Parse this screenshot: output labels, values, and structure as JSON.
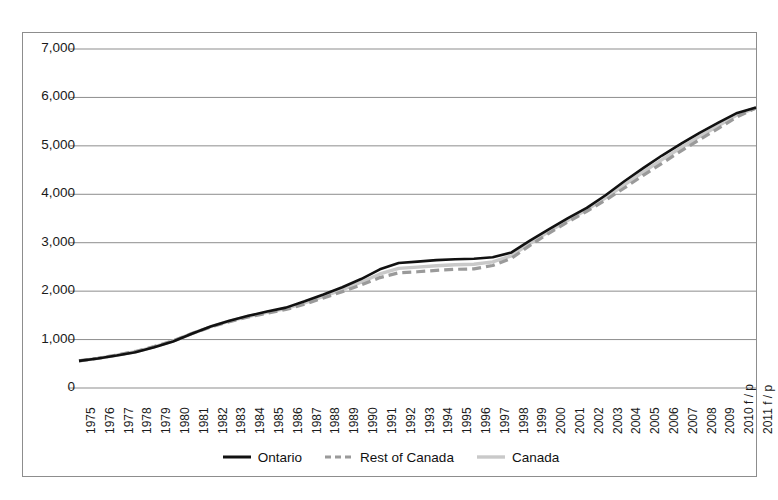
{
  "chart_data": {
    "type": "line",
    "title": "",
    "xlabel": "",
    "ylabel": "",
    "ylim": [
      0,
      7000
    ],
    "ytick_values": [
      0,
      1000,
      2000,
      3000,
      4000,
      5000,
      6000,
      7000
    ],
    "ytick_labels": [
      "0",
      "1,000",
      "2,000",
      "3,000",
      "4,000",
      "5,000",
      "6,000",
      "7,000"
    ],
    "grid": true,
    "grid_axis": "y",
    "legend_position": "bottom-center",
    "categories": [
      "1975",
      "1976",
      "1977",
      "1978",
      "1979",
      "1980",
      "1981",
      "1982",
      "1983",
      "1984",
      "1985",
      "1986",
      "1987",
      "1988",
      "1989",
      "1990",
      "1991",
      "1992",
      "1993",
      "1994",
      "1995",
      "1996",
      "1997",
      "1998",
      "1999",
      "2000",
      "2001",
      "2002",
      "2003",
      "2004",
      "2005",
      "2006",
      "2007",
      "2008",
      "2009",
      "2010 f / p",
      "2011 f / p"
    ],
    "series": [
      {
        "name": "Ontario",
        "color": "#111111",
        "style": "solid",
        "width": 2.6,
        "values": [
          560,
          610,
          670,
          740,
          840,
          960,
          1120,
          1270,
          1390,
          1490,
          1580,
          1660,
          1790,
          1930,
          2080,
          2250,
          2450,
          2580,
          2610,
          2640,
          2660,
          2670,
          2700,
          2800,
          3050,
          3280,
          3510,
          3720,
          3980,
          4270,
          4540,
          4800,
          5040,
          5270,
          5480,
          5680,
          5790
        ]
      },
      {
        "name": "Rest of Canada",
        "color": "#9a9a9a",
        "style": "dashed",
        "width": 3.2,
        "values": [
          560,
          615,
          680,
          755,
          855,
          975,
          1125,
          1260,
          1370,
          1465,
          1545,
          1620,
          1730,
          1860,
          1990,
          2130,
          2280,
          2380,
          2400,
          2430,
          2450,
          2460,
          2530,
          2680,
          2950,
          3200,
          3430,
          3650,
          3880,
          4130,
          4390,
          4640,
          4890,
          5130,
          5360,
          5600,
          5780
        ]
      },
      {
        "name": "Canada",
        "color": "#c9c9c9",
        "style": "solid",
        "width": 3.4,
        "values": [
          560,
          613,
          676,
          748,
          848,
          968,
          1123,
          1265,
          1380,
          1477,
          1561,
          1640,
          1758,
          1893,
          2031,
          2184,
          2355,
          2470,
          2495,
          2525,
          2545,
          2555,
          2605,
          2730,
          2990,
          3235,
          3465,
          3680,
          3925,
          4195,
          4460,
          4715,
          4960,
          5195,
          5415,
          5640,
          5785
        ]
      }
    ]
  },
  "legend": {
    "items": [
      {
        "label": "Ontario",
        "color": "#111111",
        "style": "solid"
      },
      {
        "label": "Rest of Canada",
        "color": "#9a9a9a",
        "style": "dashed"
      },
      {
        "label": "Canada",
        "color": "#c9c9c9",
        "style": "solid"
      }
    ]
  },
  "colors": {
    "ontario": "#111111",
    "rest_of_canada": "#9a9a9a",
    "canada": "#c9c9c9",
    "gridline": "#8d8d8d",
    "border": "#8d8d8d",
    "text": "#1a1a1a"
  }
}
